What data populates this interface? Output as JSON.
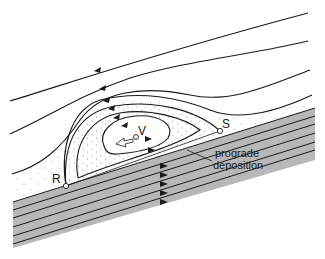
{
  "diagram": {
    "labels": {
      "R": "R",
      "S": "S",
      "V": "V",
      "annotation_line1": "prograde",
      "annotation_line2": "deposition"
    },
    "colors": {
      "strata_fill": "#b8b8b8",
      "line": "#1a1a1a",
      "background": "#ffffff",
      "stipple": "#8a8a8a"
    }
  }
}
